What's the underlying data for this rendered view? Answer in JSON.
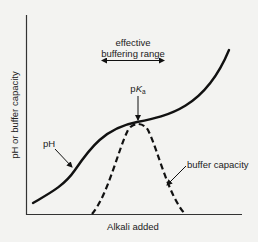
{
  "diagram": {
    "y_axis_label": "pH or buffer capacity",
    "x_axis_label": "Alkali added",
    "annotations": {
      "range_line1": "effective",
      "range_line2": "buffering range",
      "pka_prefix": "p",
      "pka_K": "K",
      "pka_sub": "a",
      "ph_label": "pH",
      "buffer_label": "buffer capacity"
    },
    "curves": [
      {
        "name": "pH",
        "style": "solid",
        "description": "sigmoidal titration curve, flattest at pKa"
      },
      {
        "name": "buffer capacity",
        "style": "dashed",
        "description": "bell-shaped, peak at pKa"
      }
    ],
    "colors": {
      "background": "#f3f3f1",
      "ink": "#111111"
    }
  }
}
